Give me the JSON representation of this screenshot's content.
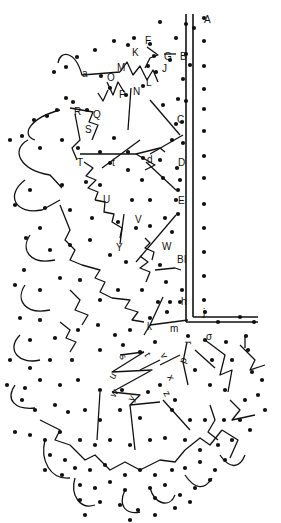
{
  "diagram": {
    "colors": {
      "ink": "#111111",
      "background": "#ffffff"
    },
    "labels_upper": [
      {
        "t": "A",
        "x": 204,
        "y": 23
      },
      {
        "t": "F",
        "x": 145,
        "y": 44
      },
      {
        "t": "G",
        "x": 164,
        "y": 60
      },
      {
        "t": "B",
        "x": 180,
        "y": 60
      },
      {
        "t": "K",
        "x": 132,
        "y": 56
      },
      {
        "t": "J",
        "x": 162,
        "y": 72
      },
      {
        "t": "M",
        "x": 117,
        "y": 71
      },
      {
        "t": "O",
        "x": 107,
        "y": 81
      },
      {
        "t": "L",
        "x": 146,
        "y": 86
      },
      {
        "t": "N",
        "x": 133,
        "y": 95
      },
      {
        "t": "P",
        "x": 119,
        "y": 98
      },
      {
        "t": "a",
        "x": 82,
        "y": 77
      },
      {
        "t": "R",
        "x": 74,
        "y": 115
      },
      {
        "t": "Q",
        "x": 93,
        "y": 118
      },
      {
        "t": "S",
        "x": 85,
        "y": 133
      },
      {
        "t": "C",
        "x": 177,
        "y": 123
      },
      {
        "t": "T",
        "x": 77,
        "y": 166
      },
      {
        "t": "t",
        "x": 112,
        "y": 166
      },
      {
        "t": "d",
        "x": 147,
        "y": 163
      },
      {
        "t": "D",
        "x": 178,
        "y": 166
      },
      {
        "t": "U",
        "x": 103,
        "y": 203
      },
      {
        "t": "E",
        "x": 178,
        "y": 204
      },
      {
        "t": "V",
        "x": 135,
        "y": 223
      },
      {
        "t": "Y",
        "x": 116,
        "y": 251
      },
      {
        "t": "W",
        "x": 162,
        "y": 250
      },
      {
        "t": "BI",
        "x": 177,
        "y": 263
      },
      {
        "t": "h",
        "x": 181,
        "y": 305
      },
      {
        "t": "j",
        "x": 203,
        "y": 316
      },
      {
        "t": "k",
        "x": 147,
        "y": 330
      },
      {
        "t": "m",
        "x": 170,
        "y": 332
      }
    ],
    "labels_lower": [
      {
        "t": "r",
        "x": 185,
        "y": 341,
        "r": 90
      },
      {
        "t": "σ",
        "x": 206,
        "y": 340,
        "r": 0
      },
      {
        "t": "p",
        "x": 185,
        "y": 364,
        "r": -70
      },
      {
        "t": "s",
        "x": 119,
        "y": 356,
        "r": 60
      },
      {
        "t": "t",
        "x": 144,
        "y": 355,
        "r": 60
      },
      {
        "t": "v",
        "x": 160,
        "y": 355,
        "r": 60
      },
      {
        "t": "u",
        "x": 114,
        "y": 380,
        "r": -60
      },
      {
        "t": "x",
        "x": 167,
        "y": 377,
        "r": 60
      },
      {
        "t": "w",
        "x": 115,
        "y": 398,
        "r": -60
      },
      {
        "t": "y",
        "x": 133,
        "y": 402,
        "r": -60
      },
      {
        "t": "z",
        "x": 163,
        "y": 393,
        "r": 60
      }
    ],
    "border_lines": [
      {
        "x1": 186,
        "y1": 14,
        "x2": 186,
        "y2": 322
      },
      {
        "x1": 193,
        "y1": 14,
        "x2": 193,
        "y2": 317
      },
      {
        "x1": 193,
        "y1": 317,
        "x2": 258,
        "y2": 317
      },
      {
        "x1": 186,
        "y1": 322,
        "x2": 258,
        "y2": 322
      }
    ],
    "dots_count_note": "pricking holes",
    "working_lines": [
      "M58,63 C60,50 75,50 82,75 L120,72",
      "M120,72 L127,62 L133,75 L140,66 L147,80 L153,70 L158,82",
      "M147,47 L158,55 L150,58 L145,68",
      "M164,54 L176,54",
      "M107,82 L113,95 L118,82 L124,92",
      "M98,93 L103,101 L108,90",
      "M131,88 L128,130",
      "M150,100 L180,135",
      "M70,108 L93,112 L89,122 L98,125 L92,140",
      "M75,114 L80,140 L72,148 L77,160",
      "M80,154 L136,154 L160,148 L165,152",
      "M136,154 L155,165 L145,170",
      "M150,154 L183,135",
      "M102,168 L140,140",
      "M146,162 L176,190",
      "M84,162 L93,168 L86,176 L96,180 L88,188 L98,192 L95,200",
      "M95,200 L105,202 L104,212 L114,214 L112,222 L122,228 L120,238",
      "M124,214 L120,244",
      "M145,238 L150,243 L145,248 L154,252 L152,260",
      "M155,270 L175,268 L181,270",
      "M140,256 L148,262 L140,268 L150,272 L146,282",
      "M136,262 L176,215",
      "M28,140 C10,150 20,170 50,175 L62,188",
      "M60,110 C30,118 20,135 35,140",
      "M25,180 C5,195 15,215 42,210 L60,200",
      "M30,235 C20,250 30,265 55,260",
      "M25,285 C15,300 25,315 50,310",
      "M20,335 C5,350 20,365 40,360",
      "M15,385 C5,400 15,410 35,408",
      "M60,205 L70,230 L65,240 L75,250 L70,260 L82,265",
      "M82,265 L100,270 L95,278 L105,282 L100,292 L112,298",
      "M112,298 L130,300 L125,308 L138,312 L132,320 L144,322",
      "M70,290 L80,300 L75,310 L88,315 L82,325",
      "M60,322 L70,330 L66,338 L76,342 L70,352",
      "M150,325 L163,297",
      "M150,325 L188,320",
      "M144,335 L150,325",
      "M120,355 L144,352",
      "M144,352 L112,372 L152,370 L112,392",
      "M140,370 L160,360",
      "M112,392 L140,395 L130,405 L160,402",
      "M160,365 L180,355",
      "M130,405 L135,450",
      "M100,392 L97,440",
      "M163,400 L190,430",
      "M187,342 L183,362",
      "M195,350 L215,368",
      "M205,340 L225,355 L220,375 L232,370 L228,392",
      "M240,345 L255,360 L250,370 L265,365",
      "M245,335 L245,348",
      "M230,400 L240,410 L232,420 L255,415",
      "M210,405 L215,420 L208,432 L218,440",
      "M183,362 L188,385",
      "M40,420 L60,430 L55,440 L70,445",
      "M70,445 L85,460 L95,455 L110,470 L125,462 L140,470 L160,460 L175,462 L185,450",
      "M185,450 L200,438 L210,445 L222,430",
      "M222,430 L238,440 L230,458",
      "M45,440 C40,460 50,480 70,478",
      "M75,478 C70,495 80,510 95,505",
      "M125,490 C118,505 125,515 140,512",
      "M150,488 C155,505 170,508 175,495",
      "M185,475 C195,490 205,490 212,478",
      "M220,455 C230,470 240,468 245,455"
    ],
    "dots": [
      [
        204,
        18
      ],
      [
        186,
        24
      ],
      [
        194,
        28
      ],
      [
        160,
        22
      ],
      [
        176,
        38
      ],
      [
        170,
        60
      ],
      [
        186,
        54
      ],
      [
        190,
        65
      ],
      [
        183,
        79
      ],
      [
        186,
        101
      ],
      [
        204,
        41
      ],
      [
        204,
        66
      ],
      [
        204,
        89
      ],
      [
        204,
        109
      ],
      [
        204,
        131
      ],
      [
        204,
        156
      ],
      [
        204,
        178
      ],
      [
        204,
        204
      ],
      [
        204,
        228
      ],
      [
        204,
        252
      ],
      [
        204,
        276
      ],
      [
        204,
        300
      ],
      [
        134,
        38
      ],
      [
        114,
        41
      ],
      [
        95,
        50
      ],
      [
        77,
        57
      ],
      [
        66,
        67
      ],
      [
        54,
        72
      ],
      [
        101,
        76
      ],
      [
        128,
        45
      ],
      [
        150,
        44
      ],
      [
        154,
        56
      ],
      [
        148,
        66
      ],
      [
        156,
        72
      ],
      [
        66,
        98
      ],
      [
        57,
        110
      ],
      [
        47,
        116
      ],
      [
        34,
        120
      ],
      [
        73,
        102
      ],
      [
        87,
        110
      ],
      [
        110,
        88
      ],
      [
        126,
        95
      ],
      [
        143,
        86
      ],
      [
        163,
        105
      ],
      [
        182,
        122
      ],
      [
        178,
        99
      ],
      [
        176,
        124
      ],
      [
        172,
        140
      ],
      [
        183,
        143
      ],
      [
        177,
        168
      ],
      [
        180,
        180
      ],
      [
        176,
        200
      ],
      [
        178,
        214
      ],
      [
        172,
        232
      ],
      [
        22,
        136
      ],
      [
        10,
        140
      ],
      [
        40,
        148
      ],
      [
        62,
        140
      ],
      [
        78,
        148
      ],
      [
        100,
        152
      ],
      [
        114,
        138
      ],
      [
        128,
        152
      ],
      [
        143,
        158
      ],
      [
        160,
        160
      ],
      [
        110,
        163
      ],
      [
        128,
        170
      ],
      [
        142,
        180
      ],
      [
        163,
        178
      ],
      [
        178,
        190
      ],
      [
        150,
        200
      ],
      [
        132,
        200
      ],
      [
        100,
        185
      ],
      [
        86,
        182
      ],
      [
        62,
        185
      ],
      [
        30,
        190
      ],
      [
        15,
        205
      ],
      [
        45,
        208
      ],
      [
        70,
        210
      ],
      [
        92,
        218
      ],
      [
        118,
        222
      ],
      [
        136,
        228
      ],
      [
        150,
        226
      ],
      [
        165,
        218
      ],
      [
        40,
        228
      ],
      [
        26,
        238
      ],
      [
        50,
        250
      ],
      [
        70,
        245
      ],
      [
        90,
        240
      ],
      [
        110,
        255
      ],
      [
        126,
        262
      ],
      [
        160,
        265
      ],
      [
        166,
        282
      ],
      [
        182,
        290
      ],
      [
        170,
        302
      ],
      [
        24,
        270
      ],
      [
        15,
        285
      ],
      [
        40,
        290
      ],
      [
        60,
        278
      ],
      [
        80,
        280
      ],
      [
        100,
        300
      ],
      [
        118,
        290
      ],
      [
        142,
        290
      ],
      [
        158,
        302
      ],
      [
        180,
        302
      ],
      [
        20,
        318
      ],
      [
        40,
        320
      ],
      [
        30,
        340
      ],
      [
        55,
        338
      ],
      [
        78,
        330
      ],
      [
        98,
        325
      ],
      [
        115,
        335
      ],
      [
        130,
        330
      ],
      [
        150,
        318
      ],
      [
        167,
        312
      ],
      [
        10,
        360
      ],
      [
        30,
        368
      ],
      [
        50,
        360
      ],
      [
        72,
        360
      ],
      [
        100,
        350
      ],
      [
        123,
        345
      ],
      [
        140,
        352
      ],
      [
        155,
        342
      ],
      [
        205,
        312
      ],
      [
        218,
        322
      ],
      [
        240,
        317
      ],
      [
        254,
        322
      ],
      [
        188,
        336
      ],
      [
        205,
        340
      ],
      [
        226,
        342
      ],
      [
        246,
        336
      ],
      [
        248,
        350
      ],
      [
        212,
        360
      ],
      [
        232,
        360
      ],
      [
        252,
        372
      ],
      [
        262,
        380
      ],
      [
        195,
        370
      ],
      [
        210,
        385
      ],
      [
        225,
        390
      ],
      [
        245,
        400
      ],
      [
        258,
        395
      ],
      [
        265,
        410
      ],
      [
        7,
        385
      ],
      [
        25,
        388
      ],
      [
        40,
        380
      ],
      [
        60,
        385
      ],
      [
        78,
        380
      ],
      [
        100,
        390
      ],
      [
        122,
        390
      ],
      [
        148,
        392
      ],
      [
        160,
        385
      ],
      [
        175,
        400
      ],
      [
        22,
        400
      ],
      [
        35,
        410
      ],
      [
        55,
        405
      ],
      [
        68,
        412
      ],
      [
        85,
        410
      ],
      [
        100,
        420
      ],
      [
        120,
        410
      ],
      [
        140,
        418
      ],
      [
        172,
        410
      ],
      [
        190,
        420
      ],
      [
        205,
        420
      ],
      [
        224,
        420
      ],
      [
        240,
        420
      ],
      [
        250,
        430
      ],
      [
        15,
        432
      ],
      [
        30,
        435
      ],
      [
        45,
        440
      ],
      [
        60,
        432
      ],
      [
        80,
        440
      ],
      [
        95,
        445
      ],
      [
        110,
        440
      ],
      [
        130,
        445
      ],
      [
        150,
        440
      ],
      [
        165,
        438
      ],
      [
        185,
        440
      ],
      [
        200,
        450
      ],
      [
        218,
        445
      ],
      [
        232,
        440
      ],
      [
        50,
        455
      ],
      [
        65,
        460
      ],
      [
        75,
        468
      ],
      [
        90,
        470
      ],
      [
        105,
        465
      ],
      [
        125,
        475
      ],
      [
        140,
        470
      ],
      [
        155,
        475
      ],
      [
        172,
        470
      ],
      [
        185,
        468
      ],
      [
        200,
        462
      ],
      [
        215,
        470
      ],
      [
        225,
        460
      ],
      [
        45,
        470
      ],
      [
        62,
        475
      ],
      [
        80,
        485
      ],
      [
        95,
        488
      ],
      [
        110,
        482
      ],
      [
        125,
        490
      ],
      [
        150,
        488
      ],
      [
        165,
        485
      ],
      [
        180,
        495
      ],
      [
        195,
        488
      ],
      [
        210,
        480
      ],
      [
        80,
        500
      ],
      [
        100,
        502
      ],
      [
        120,
        505
      ],
      [
        138,
        510
      ],
      [
        155,
        498
      ],
      [
        175,
        508
      ],
      [
        190,
        502
      ],
      [
        85,
        515
      ],
      [
        130,
        520
      ],
      [
        155,
        515
      ]
    ]
  }
}
